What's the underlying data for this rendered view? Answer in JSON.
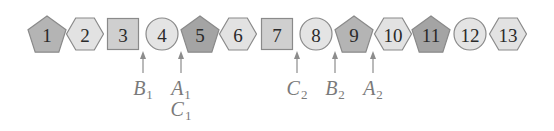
{
  "diagram": {
    "shape_row_y": 34,
    "colors": {
      "stroke": "#8a8a8a",
      "pentagon_fill": "#b4b4b4",
      "pentagon_dark_fill": "#a4a4a4",
      "hexagon_fill": "#e2e2e2",
      "square_fill": "#cfcfcf",
      "circle_fill": "#e4e4e4",
      "arrow": "#8c8c8c",
      "label": "#7a7a7a"
    },
    "items": [
      {
        "label": "1",
        "shape": "pentagon",
        "x": 47
      },
      {
        "label": "2",
        "shape": "hexagon",
        "x": 85
      },
      {
        "label": "3",
        "shape": "square",
        "x": 123
      },
      {
        "label": "4",
        "shape": "circle",
        "x": 162
      },
      {
        "label": "5",
        "shape": "pentagon",
        "x": 200
      },
      {
        "label": "6",
        "shape": "hexagon",
        "x": 238
      },
      {
        "label": "7",
        "shape": "square",
        "x": 277
      },
      {
        "label": "8",
        "shape": "circle",
        "x": 316
      },
      {
        "label": "9",
        "shape": "pentagon",
        "x": 354
      },
      {
        "label": "10",
        "shape": "hexagon",
        "x": 393
      },
      {
        "label": "11",
        "shape": "pentagon",
        "x": 431
      },
      {
        "label": "12",
        "shape": "circle",
        "x": 470
      },
      {
        "label": "13",
        "shape": "hexagon",
        "x": 508
      }
    ],
    "pointers": [
      {
        "x": 143,
        "labels": [
          {
            "letter": "B",
            "sub": "1"
          }
        ]
      },
      {
        "x": 181,
        "labels": [
          {
            "letter": "A",
            "sub": "1"
          },
          {
            "letter": "C",
            "sub": "1"
          }
        ]
      },
      {
        "x": 297,
        "labels": [
          {
            "letter": "C",
            "sub": "2"
          }
        ]
      },
      {
        "x": 335,
        "labels": [
          {
            "letter": "B",
            "sub": "2"
          }
        ]
      },
      {
        "x": 373,
        "labels": [
          {
            "letter": "A",
            "sub": "2"
          }
        ]
      }
    ]
  }
}
